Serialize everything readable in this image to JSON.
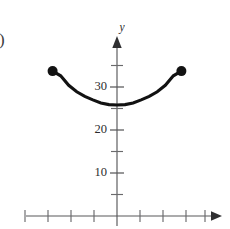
{
  "figure": {
    "panel_label": ")",
    "background_color": "#ffffff",
    "curve_color": "#121212",
    "axis_color": "#58585a",
    "text_color": "#2b2b2d"
  },
  "axes": {
    "y_axis_name": "y",
    "x_axis_name": "",
    "origin_px": {
      "x": 117,
      "y": 216
    },
    "y_unit_px_per_10": 43,
    "x_unit_px": 23,
    "y_tick_labels": [
      "30",
      "20",
      "10"
    ],
    "y_tick_values": [
      30,
      20,
      10
    ],
    "y_minor_tick_values": [
      5,
      15,
      25,
      35
    ],
    "x_tick_count_left": 4,
    "x_tick_count_right": 4,
    "x_tick_labels": [],
    "y_arrow": "up-arrowhead",
    "x_arrow": "right-arrowhead"
  },
  "chart_data": {
    "type": "line",
    "title": "",
    "subtitle": "",
    "xlabel": "",
    "ylabel": "y",
    "xlim": [
      -5,
      5
    ],
    "ylim": [
      0,
      38
    ],
    "grid": false,
    "legend": false,
    "legend_position": "none",
    "annotations": [],
    "series": [
      {
        "name": "parabola",
        "shape": "upward-parabola",
        "vertex": {
          "x": 0.0,
          "y": 25.8
        },
        "domain": [
          -2.8,
          2.8
        ],
        "endpoint_style": "closed",
        "x": [
          -2.8,
          -2.45,
          -2.1,
          -1.75,
          -1.4,
          -1.05,
          -0.7,
          -0.35,
          0.0,
          0.35,
          0.7,
          1.05,
          1.4,
          1.75,
          2.1,
          2.45,
          2.8
        ],
        "values": [
          33.7,
          32.6,
          30.4,
          28.9,
          27.8,
          27.0,
          26.3,
          25.9,
          25.8,
          25.9,
          26.3,
          27.0,
          27.8,
          28.9,
          30.4,
          32.6,
          33.7
        ]
      }
    ],
    "markers": [
      {
        "name": "left-endpoint",
        "x": -2.8,
        "y": 33.7,
        "filled": true
      },
      {
        "name": "right-endpoint",
        "x": 2.8,
        "y": 33.7,
        "filled": true
      }
    ]
  }
}
